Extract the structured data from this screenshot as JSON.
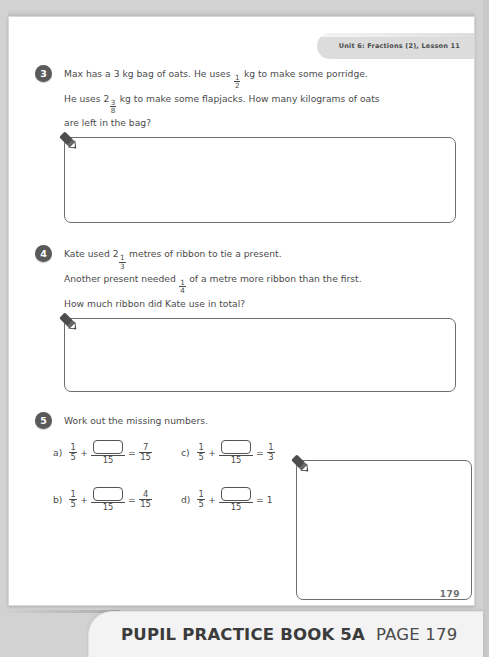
{
  "header": {
    "unit_label": "Unit 6: Fractions (2), Lesson 11"
  },
  "questions": [
    {
      "number": "3",
      "lines": [
        {
          "parts": [
            {
              "t": "text",
              "v": "Max has a 3 kg bag of oats. He uses "
            },
            {
              "t": "frac",
              "n": "1",
              "d": "2"
            },
            {
              "t": "text",
              "v": " kg to make some porridge."
            }
          ]
        },
        {
          "parts": [
            {
              "t": "text",
              "v": "He uses 2"
            },
            {
              "t": "frac",
              "n": "3",
              "d": "8"
            },
            {
              "t": "text",
              "v": " kg to make some flapjacks. How many kilograms of oats"
            }
          ]
        },
        {
          "parts": [
            {
              "t": "text",
              "v": "are left in the bag?"
            }
          ]
        }
      ],
      "answer_box": {
        "height": 86,
        "pencil": "pencil-icon"
      }
    },
    {
      "number": "4",
      "lines": [
        {
          "parts": [
            {
              "t": "text",
              "v": "Kate used 2"
            },
            {
              "t": "frac",
              "n": "1",
              "d": "3"
            },
            {
              "t": "text",
              "v": " metres of ribbon to tie a present."
            }
          ]
        },
        {
          "parts": [
            {
              "t": "text",
              "v": "Another present needed "
            },
            {
              "t": "frac",
              "n": "1",
              "d": "4"
            },
            {
              "t": "text",
              "v": " of a metre more ribbon than the first."
            }
          ]
        },
        {
          "parts": [
            {
              "t": "text",
              "v": "How much ribbon did Kate use in total?"
            }
          ]
        }
      ],
      "answer_box": {
        "height": 74,
        "pencil": "pencil-icon"
      }
    },
    {
      "number": "5",
      "lines": [
        {
          "parts": [
            {
              "t": "text",
              "v": "Work out the missing numbers."
            }
          ]
        }
      ],
      "equations": [
        {
          "label": "a)",
          "left_num": "1",
          "left_den": "5",
          "blank_den": "15",
          "result_num": "7",
          "result_den": "15",
          "result_whole": ""
        },
        {
          "label": "c)",
          "left_num": "1",
          "left_den": "5",
          "blank_den": "15",
          "result_num": "1",
          "result_den": "3",
          "result_whole": ""
        },
        {
          "label": "b)",
          "left_num": "1",
          "left_den": "5",
          "blank_den": "15",
          "result_num": "4",
          "result_den": "15",
          "result_whole": ""
        },
        {
          "label": "d)",
          "left_num": "1",
          "left_den": "5",
          "blank_den": "15",
          "result_num": "",
          "result_den": "",
          "result_whole": "1"
        }
      ],
      "answer_box": {
        "pencil": "pencil-icon"
      }
    }
  ],
  "symbols": {
    "plus": "+",
    "equals": "="
  },
  "page_number": "179",
  "banner": {
    "book_title": "PUPIL PRACTICE BOOK 5A",
    "page_label": "PAGE 179"
  },
  "colors": {
    "page_background": "#ffffff",
    "text": "#4b4b4b",
    "number_badge": "#5a5a5a",
    "unit_tab": "#dcdcdc",
    "banner_background": "#f3f3f3",
    "box_border": "#6d6d6d"
  }
}
